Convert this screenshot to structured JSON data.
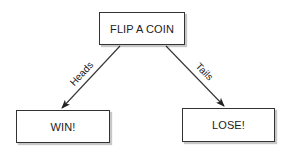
{
  "diagram": {
    "type": "decision-tree",
    "nodes": {
      "root": {
        "label": "FLIP A COIN"
      },
      "win": {
        "label": "WIN!"
      },
      "lose": {
        "label": "LOSE!"
      }
    },
    "edges": [
      {
        "from": "root",
        "to": "win",
        "label": "Heads"
      },
      {
        "from": "root",
        "to": "lose",
        "label": "Tails"
      }
    ],
    "colors": {
      "stroke": "#333333",
      "text": "#222222",
      "background": "#ffffff"
    }
  }
}
